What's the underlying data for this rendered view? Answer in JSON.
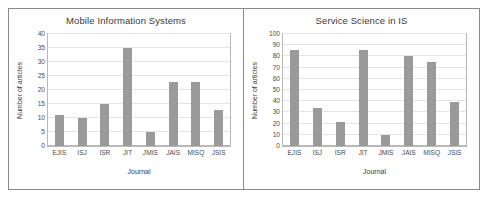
{
  "figure": {
    "border_color": "#8a8a8a",
    "bar_color": "#9a9a9a"
  },
  "chart_data": [
    {
      "type": "bar",
      "title": "Mobile Information Systems",
      "xlabel": "Journal",
      "ylabel": "Number of articles",
      "categories": [
        "EJIS",
        "ISJ",
        "ISR",
        "JIT",
        "JMIS",
        "JAIS",
        "MISQ",
        "JSIS"
      ],
      "values": [
        11,
        10,
        15,
        35,
        5,
        23,
        23,
        13
      ],
      "ylim": [
        0,
        40
      ],
      "yticks": [
        0,
        5,
        10,
        15,
        20,
        25,
        30,
        35,
        40
      ],
      "grid": true,
      "legend": "none"
    },
    {
      "type": "bar",
      "title": "Service Science in IS",
      "xlabel": "Journal",
      "ylabel": "Number of articles",
      "categories": [
        "EJIS",
        "ISJ",
        "ISR",
        "JIT",
        "JMIS",
        "JAIS",
        "MISQ",
        "JSIS"
      ],
      "values": [
        86,
        34,
        21,
        86,
        10,
        80,
        75,
        39
      ],
      "ylim": [
        0,
        100
      ],
      "yticks": [
        0,
        10,
        20,
        30,
        40,
        50,
        60,
        70,
        80,
        90,
        100
      ],
      "grid": true,
      "legend": "none"
    }
  ]
}
